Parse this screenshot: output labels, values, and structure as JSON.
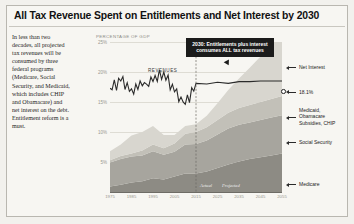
{
  "title": "All Tax Revenue Spent on Entitlements and Net Interest by 2030",
  "blurb": "In less than two decades, all projected tax revenues will be consumed by three federal programs (Medicare, Social Security, and Medicaid, which includes CHIP and Obamacare) and net interest on the debt. Entitlement reform is a must.",
  "callout": "2030: Entitlements plus interest consumes ALL tax revenues",
  "revenue_label": "REVENUES",
  "actual_label": "Actual",
  "projected_label": "Projected",
  "pct_callout": "18.1%",
  "series_labels": {
    "net_interest": "Net Interest",
    "medicaid": "Medicaid,",
    "medicaid2": "Obamacare",
    "medicaid3": "Subsidies, CHIP",
    "social_security": "Social Security",
    "medicare": "Medicare"
  },
  "colors": {
    "medicare": "#8d8b84",
    "social_security": "#a7a59e",
    "medicaid": "#c2c0b8",
    "net_interest": "#d8d6cf",
    "revenue_line": "#2b2b2b",
    "callout_bg": "#1b1b1b"
  },
  "chart_data": {
    "type": "area",
    "title": "All Tax Revenue Spent on Entitlements and Net Interest by 2030",
    "xlabel": "",
    "ylabel": "PERCENTAGE OF GDP",
    "ylim": [
      0,
      25
    ],
    "yticks": [
      "25%",
      "20%",
      "15%",
      "10%",
      "5%"
    ],
    "ytick_values": [
      25,
      20,
      15,
      10,
      5
    ],
    "xticks": [
      "1975",
      "1985",
      "1995",
      "2005",
      "2015",
      "2025",
      "2035",
      "2045",
      "2055"
    ],
    "grid": true,
    "legend": "right-side direct labels",
    "annotations": [
      "2030: Entitlements plus interest consumes ALL tax revenues",
      "18.1%",
      "Actual",
      "Projected",
      "REVENUES"
    ],
    "divider_year": 2015,
    "x": [
      1975,
      1980,
      1985,
      1990,
      1995,
      2000,
      2005,
      2010,
      2015,
      2020,
      2025,
      2030,
      2035,
      2040,
      2045,
      2050,
      2055
    ],
    "series": [
      {
        "name": "Medicare",
        "values": [
          0.9,
          1.2,
          1.6,
          1.8,
          2.3,
          2.1,
          2.6,
          3.1,
          3.1,
          3.4,
          4.0,
          4.6,
          5.1,
          5.5,
          5.8,
          6.1,
          6.4
        ]
      },
      {
        "name": "Social Security",
        "values": [
          4.0,
          4.3,
          4.3,
          4.3,
          4.5,
          4.1,
          4.1,
          4.8,
          4.9,
          5.2,
          5.6,
          6.0,
          6.1,
          6.1,
          6.2,
          6.3,
          6.4
        ]
      },
      {
        "name": "Medicaid, Obamacare Subsidies, CHIP",
        "values": [
          0.4,
          0.5,
          0.5,
          0.8,
          1.1,
          1.1,
          1.4,
          1.8,
          2.0,
          2.2,
          2.4,
          2.6,
          2.8,
          2.9,
          3.0,
          3.1,
          3.2
        ]
      },
      {
        "name": "Net Interest",
        "values": [
          1.5,
          1.9,
          3.0,
          3.1,
          3.1,
          2.2,
          1.4,
          1.3,
          1.3,
          1.9,
          2.8,
          3.8,
          4.9,
          6.2,
          7.6,
          9.2,
          11.0
        ]
      },
      {
        "name": "Revenues",
        "values": [
          17.3,
          18.5,
          17.2,
          17.7,
          18.4,
          20.0,
          16.7,
          14.6,
          18.1,
          18.0,
          18.3,
          18.1,
          18.4,
          18.4,
          18.5,
          18.5,
          18.5
        ]
      }
    ]
  }
}
